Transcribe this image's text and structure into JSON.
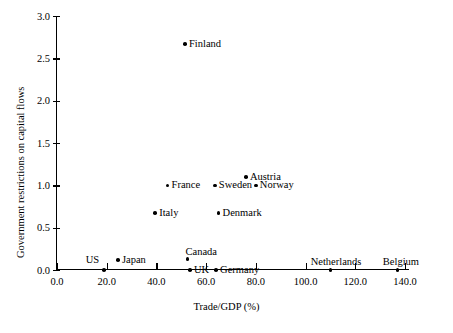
{
  "chart_data": {
    "type": "scatter",
    "title": "",
    "xlabel": "Trade/GDP (%)",
    "ylabel": "Government restrictions on capital flows",
    "xlim": [
      0,
      140
    ],
    "ylim": [
      0,
      3.0
    ],
    "xticks": [
      "0.0",
      "20.0",
      "40.0",
      "60.0",
      "80.0",
      "100.0",
      "120.0",
      "140.0"
    ],
    "xtick_values": [
      0,
      20,
      40,
      60,
      80,
      100,
      120,
      140
    ],
    "yticks": [
      "0.0",
      "0.5",
      "1.0",
      "1.5",
      "2.0",
      "2.5",
      "3.0"
    ],
    "ytick_values": [
      0,
      0.5,
      1.0,
      1.5,
      2.0,
      2.5,
      3.0
    ],
    "grid": false,
    "legend": false,
    "points": [
      {
        "label": "Finland",
        "x": 51.5,
        "y": 2.67,
        "label_pos": "right"
      },
      {
        "label": "Austria",
        "x": 76.0,
        "y": 1.1,
        "label_pos": "right"
      },
      {
        "label": "France",
        "x": 44.5,
        "y": 1.0,
        "label_pos": "right"
      },
      {
        "label": "Sweden",
        "x": 63.5,
        "y": 1.0,
        "label_pos": "right"
      },
      {
        "label": "Norway",
        "x": 80.0,
        "y": 1.0,
        "label_pos": "right"
      },
      {
        "label": "Italy",
        "x": 39.5,
        "y": 0.67,
        "label_pos": "right"
      },
      {
        "label": "Denmark",
        "x": 65.0,
        "y": 0.67,
        "label_pos": "right"
      },
      {
        "label": "Canada",
        "x": 52.5,
        "y": 0.13,
        "label_pos": "above"
      },
      {
        "label": "Japan",
        "x": 24.5,
        "y": 0.12,
        "label_pos": "right"
      },
      {
        "label": "US",
        "x": 19.0,
        "y": 0.0,
        "label_pos": "left"
      },
      {
        "label": "UK",
        "x": 53.5,
        "y": 0.0,
        "label_pos": "right"
      },
      {
        "label": "Germany",
        "x": 64.0,
        "y": 0.0,
        "label_pos": "right"
      },
      {
        "label": "Netherlands",
        "x": 110.0,
        "y": 0.0,
        "label_pos": "above-right"
      },
      {
        "label": "Belgium",
        "x": 137.0,
        "y": 0.0,
        "label_pos": "above-right"
      }
    ]
  },
  "axes": {
    "x_title": "Trade/GDP (%)",
    "y_title": "Government restrictions on capital flows"
  }
}
